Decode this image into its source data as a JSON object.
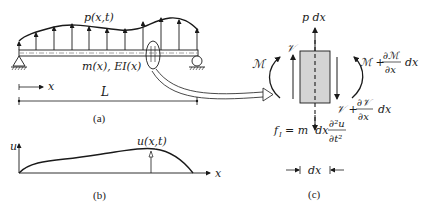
{
  "figure": {
    "panel_a": {
      "caption": "(a)",
      "load_label": "p(x,t)",
      "beam_label": "m(x), EI(x)",
      "axis_label": "x",
      "length_label": "L"
    },
    "panel_b": {
      "caption": "(b)",
      "y_axis_label": "u",
      "x_axis_label": "x",
      "curve_label": "u(x,t)"
    },
    "panel_c": {
      "caption": "(c)",
      "load_label": "p dx",
      "shear_left": "𝒱",
      "moment_left": "ℳ",
      "moment_right_prefix": "ℳ +",
      "moment_right_num": "∂ℳ",
      "moment_right_den": "∂x",
      "moment_right_suffix": "dx",
      "shear_right_prefix": "𝒱 +",
      "shear_right_num": "∂𝒱",
      "shear_right_den": "∂x",
      "shear_right_suffix": "dx",
      "inertia_prefix": "f",
      "inertia_sub": "I",
      "inertia_mid": "= m  dx",
      "inertia_num": "∂²u",
      "inertia_den": "∂t²",
      "width_label": "dx"
    },
    "colors": {
      "ink": "#1a1a1a",
      "element_fill": "#d4d4d4"
    }
  }
}
